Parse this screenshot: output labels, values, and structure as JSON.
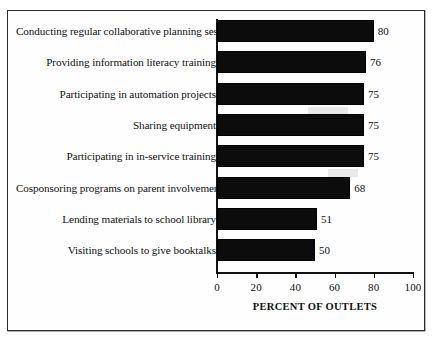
{
  "chart_data": {
    "type": "bar",
    "orientation": "horizontal",
    "title": "",
    "xlabel": "PERCENT OF OUTLETS",
    "ylabel": "",
    "xlim": [
      0,
      100
    ],
    "xticks": [
      0,
      20,
      40,
      60,
      80,
      100
    ],
    "grid": false,
    "legend": null,
    "bar_color": "#0c0c0c",
    "categories": [
      "Conducting regular collaborative planning sessions",
      "Providing information literacy training",
      "Participating in automation projects",
      "Sharing equipment",
      "Participating in in-service training",
      "Cosponsoring programs on parent involvement",
      "Lending materials to school library",
      "Visiting schools to give booktalks"
    ],
    "values": [
      80,
      76,
      75,
      75,
      75,
      68,
      51,
      50
    ],
    "value_labels": [
      "80",
      "76",
      "75",
      "75",
      "75",
      "68",
      "51",
      "50"
    ]
  }
}
